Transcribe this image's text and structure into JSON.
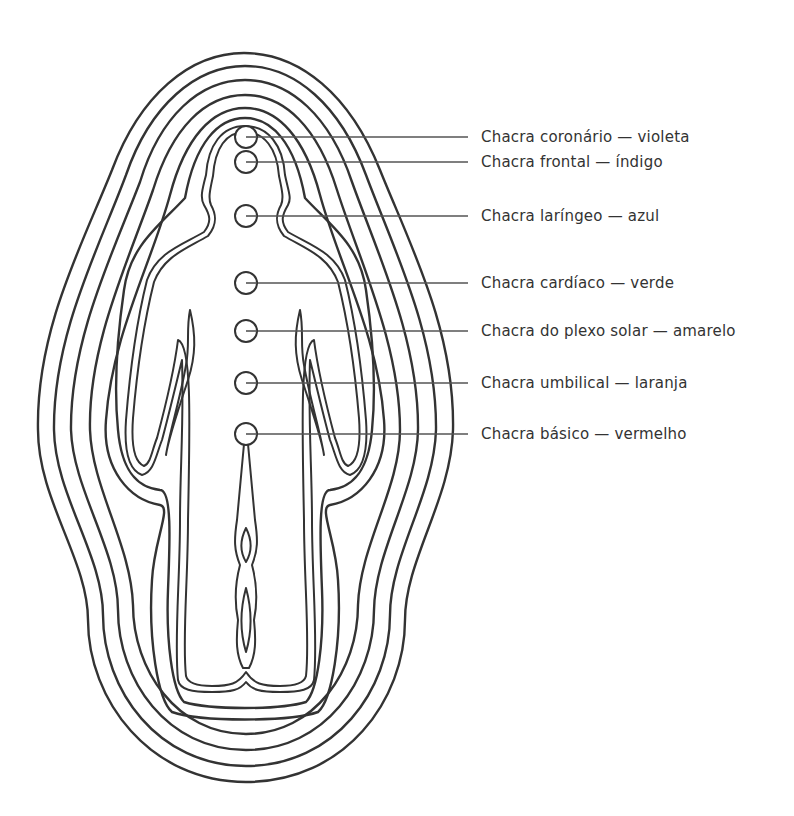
{
  "diagram": {
    "type": "aura-chakra-figure",
    "stroke_color": "#333333",
    "background": "#ffffff",
    "aura_layers": 8,
    "chakras": [
      {
        "id": "coronario",
        "label": "Chacra coronário — violeta",
        "y": 137
      },
      {
        "id": "frontal",
        "label": "Chacra frontal — índigo",
        "y": 162
      },
      {
        "id": "laringeo",
        "label": "Chacra laríngeo — azul",
        "y": 216
      },
      {
        "id": "cardiaco",
        "label": "Chacra cardíaco — verde",
        "y": 283
      },
      {
        "id": "plexo-solar",
        "label": "Chacra do plexo solar — amarelo",
        "y": 331
      },
      {
        "id": "umbilical",
        "label": "Chacra umbilical — laranja",
        "y": 383
      },
      {
        "id": "basico",
        "label": "Chacra básico — vermelho",
        "y": 434
      }
    ]
  }
}
